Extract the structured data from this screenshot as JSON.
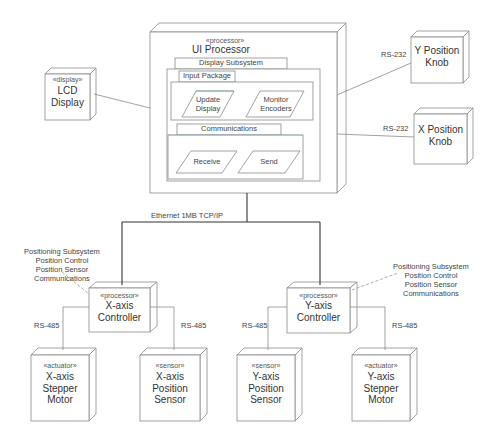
{
  "diagram": {
    "type": "UML deployment diagram",
    "colors": {
      "line": "#8a8a8a",
      "dark_line": "#333333",
      "text": "#3a3a3a",
      "accent_line": "#5aa39a"
    },
    "nodes": {
      "ui_processor": {
        "stereotype": "«processor»",
        "name": "UI Processor"
      },
      "lcd_display": {
        "stereotype": "«display»",
        "name_line1": "LCD",
        "name_line2": "Display"
      },
      "y_knob": {
        "name_line1": "Y Position",
        "name_line2": "Knob"
      },
      "x_knob": {
        "name_line1": "X Position",
        "name_line2": "Knob"
      },
      "x_controller": {
        "stereotype": "«processor»",
        "name_line1": "X-axis",
        "name_line2": "Controller"
      },
      "y_controller": {
        "stereotype": "«processor»",
        "name_line1": "Y-axis",
        "name_line2": "Controller"
      },
      "x_stepper": {
        "stereotype": "«actuator»",
        "name_line1": "X-axis",
        "name_line2": "Stepper",
        "name_line3": "Motor"
      },
      "x_sensor": {
        "stereotype": "«sensor»",
        "name_line1": "X-axis",
        "name_line2": "Position",
        "name_line3": "Sensor"
      },
      "y_sensor": {
        "stereotype": "«sensor»",
        "name_line1": "Y-axis",
        "name_line2": "Position",
        "name_line3": "Sensor"
      },
      "y_stepper": {
        "stereotype": "«actuator»",
        "name_line1": "Y-axis",
        "name_line2": "Stepper",
        "name_line3": "Motor"
      }
    },
    "packages": {
      "display_subsystem": "Display Subsystem",
      "input_package": "Input Package",
      "communications": "Communications"
    },
    "components": {
      "update_display_line1": "Update",
      "update_display_line2": "Display",
      "monitor_encoders_line1": "Monitor",
      "monitor_encoders_line2": "Encoders",
      "receive": "Receive",
      "send": "Send"
    },
    "connections": {
      "ethernet": "Ethernet 1MB TCP/IP",
      "rs232_y": "RS-232",
      "rs232_x": "RS-232",
      "rs485_x_stepper": "RS-485",
      "rs485_x_sensor": "RS-485",
      "rs485_y_sensor": "RS-485",
      "rs485_y_stepper": "RS-485"
    },
    "notes": {
      "x_positioning": [
        "Positioning Subsystem",
        "Position Control",
        "Position Sensor",
        "Communications"
      ],
      "y_positioning": [
        "Positioning Subsystem",
        "Position Control",
        "Position Sensor",
        "Communications"
      ]
    }
  }
}
